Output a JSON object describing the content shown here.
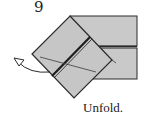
{
  "step": {
    "number": "9",
    "instruction": "Unfold."
  },
  "colors": {
    "paper": "#c9c9c9",
    "line": "#2a2a2a",
    "background": "#ffffff"
  },
  "icons": {
    "arrow": "curved-unfold-arrow"
  }
}
